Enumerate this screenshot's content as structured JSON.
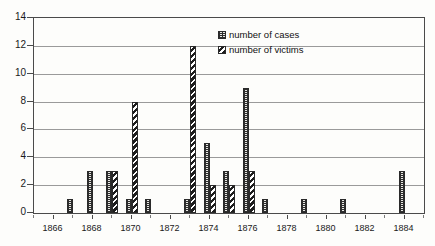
{
  "chart_data": {
    "type": "bar",
    "title": "",
    "subtitle": "",
    "xlabel": "",
    "ylabel": "",
    "xlim": [
      1865,
      1885
    ],
    "ylim": [
      0,
      14
    ],
    "y_ticks": [
      0,
      2,
      4,
      6,
      8,
      10,
      12,
      14
    ],
    "x_ticks": [
      1866,
      1868,
      1870,
      1872,
      1874,
      1876,
      1878,
      1880,
      1882,
      1884
    ],
    "x_tick_labels": [
      "1866",
      "1868",
      "1870",
      "1872",
      "1874",
      "1876",
      "1878",
      "1880",
      "1882",
      "1884"
    ],
    "grid": true,
    "grid_axis": "y",
    "legend_position": "upper-right",
    "categories": [
      1866,
      1867,
      1868,
      1869,
      1870,
      1871,
      1872,
      1873,
      1874,
      1875,
      1876,
      1877,
      1878,
      1879,
      1880,
      1881,
      1882,
      1883,
      1884
    ],
    "series": [
      {
        "name": "number of cases",
        "pattern": "dotted-light",
        "color": "#e8e8e4",
        "values": [
          0,
          1,
          3,
          3,
          1,
          1,
          0,
          1,
          5,
          3,
          9,
          1,
          0,
          1,
          0,
          1,
          0,
          0,
          3
        ]
      },
      {
        "name": "number of victims",
        "pattern": "diagonal-hatch-dark",
        "color": "#1d1d1d",
        "values": [
          0,
          0,
          0,
          3,
          8,
          0,
          0,
          12,
          2,
          2,
          3,
          0,
          0,
          0,
          0,
          0,
          0,
          0,
          0
        ]
      }
    ]
  },
  "legend": {
    "items": [
      {
        "label": "number of cases",
        "swatch_name": "legend-swatch-cases"
      },
      {
        "label": "number of victims",
        "swatch_name": "legend-swatch-victims"
      }
    ]
  },
  "colors": {
    "axis": "#4a4a4a",
    "gridline": "#9a9a9a",
    "background": "#fdfdfb",
    "cases": "#e8e8e4",
    "victims": "#1d1d1d"
  }
}
